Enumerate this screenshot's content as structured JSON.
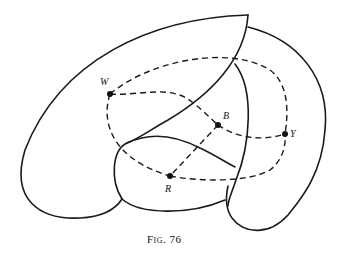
{
  "figure": {
    "caption": "Fig. 76",
    "points": [
      {
        "id": "W",
        "label": "W"
      },
      {
        "id": "B",
        "label": "B"
      },
      {
        "id": "Y",
        "label": "Y"
      },
      {
        "id": "R",
        "label": "R"
      }
    ],
    "edges": [
      {
        "from": "W",
        "to": "B",
        "style": "dashed"
      },
      {
        "from": "B",
        "to": "Y",
        "style": "dashed"
      },
      {
        "from": "B",
        "to": "R",
        "style": "dashed"
      },
      {
        "from": "W",
        "to": "Y",
        "style": "dashed",
        "route": "upper"
      },
      {
        "from": "W",
        "to": "R",
        "style": "dashed"
      },
      {
        "from": "R",
        "to": "Y",
        "style": "dashed",
        "route": "lower"
      }
    ],
    "regions": [
      "left-large-region",
      "right-crescent-region",
      "middle-strip-region",
      "bottom-bulb-region"
    ]
  }
}
